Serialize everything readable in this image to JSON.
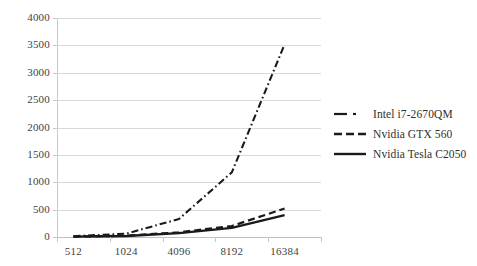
{
  "chart_data": {
    "type": "line",
    "title": "",
    "xlabel": "",
    "ylabel": "",
    "categories": [
      "512",
      "1024",
      "4096",
      "8192",
      "16384"
    ],
    "x_tick_labels": [
      "512",
      "1024",
      "4096",
      "8192",
      "16384"
    ],
    "y_tick_labels": [
      "4000",
      "3500",
      "3000",
      "2500",
      "2000",
      "1500",
      "1000",
      "500",
      "0"
    ],
    "ylim": [
      0,
      4000
    ],
    "y_major_step": 500,
    "grid": "horizontal",
    "legend_position": "right",
    "series": [
      {
        "name": "Intel i7-2670QM",
        "style": "dash-dot",
        "color": "#1a1a1a",
        "values": [
          15,
          60,
          330,
          1180,
          3520
        ]
      },
      {
        "name": "Nvidia GTX 560",
        "style": "dashed",
        "color": "#1a1a1a",
        "values": [
          8,
          22,
          85,
          200,
          520
        ]
      },
      {
        "name": "Nvidia Tesla C2050",
        "style": "solid",
        "color": "#1a1a1a",
        "values": [
          6,
          18,
          70,
          165,
          400
        ]
      }
    ]
  },
  "legend": {
    "entries": [
      {
        "label": "Intel i7-2670QM"
      },
      {
        "label": "Nvidia GTX 560"
      },
      {
        "label": "Nvidia Tesla C2050"
      }
    ]
  },
  "colors": {
    "ink": "#1a1a1a",
    "grid": "#d9d9d9",
    "axis": "#c9c9c9",
    "text": "#3f3f3f",
    "background": "#ffffff"
  }
}
